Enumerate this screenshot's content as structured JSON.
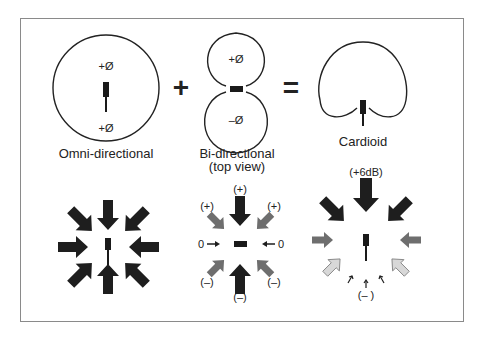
{
  "top_row": {
    "omni": {
      "caption": "Omni-directional",
      "top_phase": "+Ø",
      "bottom_phase": "+Ø"
    },
    "plus_operator": "+",
    "bidirectional": {
      "caption_line1": "Bi-directional",
      "caption_line2": "(top view)",
      "top_phase": "+Ø",
      "bottom_phase": "–Ø"
    },
    "equals_operator": "=",
    "cardioid": {
      "caption": "Cardioid"
    }
  },
  "bottom_row": {
    "omni_arrows": {
      "description": "8 equal dark arrows pointing inward"
    },
    "bidirectional_arrows": {
      "top": "(+)",
      "top_left": "(+)",
      "top_right": "(+)",
      "left": "0",
      "right": "0",
      "bottom_left": "(–)",
      "bottom_right": "(–)",
      "bottom": "(–)"
    },
    "cardioid_arrows": {
      "top": "(+6dB)",
      "bottom": "(– )"
    }
  },
  "colors": {
    "dark_arrow": "#1e1e1e",
    "gray_arrow": "#6e6e6e",
    "light_arrow": "#b4b4b4",
    "frame": "#8a8a8a",
    "line": "#222222"
  }
}
